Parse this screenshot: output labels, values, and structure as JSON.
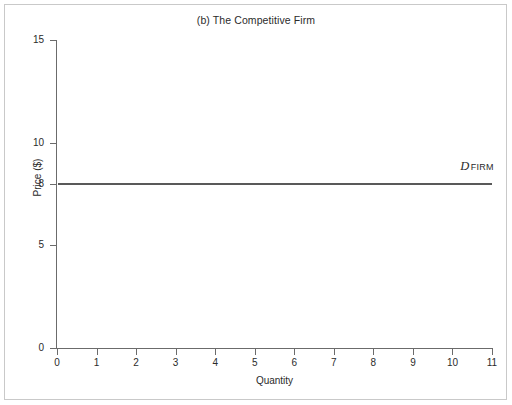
{
  "chart_data": {
    "type": "line",
    "title": "(b) The Competitive Firm",
    "xlabel": "Quantity",
    "ylabel": "Price ($)",
    "xlim": [
      0,
      11
    ],
    "ylim": [
      0,
      15
    ],
    "grid": false,
    "legend_position": "inline-right",
    "x_ticks": [
      "0",
      "1",
      "2",
      "3",
      "4",
      "5",
      "6",
      "7",
      "8",
      "9",
      "10",
      "11"
    ],
    "x_tick_values": [
      0,
      1,
      2,
      3,
      4,
      5,
      6,
      7,
      8,
      9,
      10,
      11
    ],
    "y_ticks": [
      "0",
      "5",
      "8",
      "10",
      "15"
    ],
    "y_tick_values": [
      0,
      5,
      8,
      10,
      15
    ],
    "series": [
      {
        "name": "D FIRM",
        "label_main": "D",
        "label_sub": "FIRM",
        "description": "Perfectly elastic (horizontal) firm demand curve at price 8",
        "color": "#595959",
        "x": [
          0,
          11
        ],
        "values": [
          8,
          8
        ]
      }
    ],
    "annotations": [
      {
        "name": "demand-curve-label",
        "text": "D FIRM",
        "x": 10.4,
        "y": 8.8
      }
    ]
  },
  "colors": {
    "line": "#595959",
    "axis": "#6b6b6b",
    "text": "#2b2b2b",
    "frame": "#c9c9c9",
    "background": "#ffffff"
  }
}
